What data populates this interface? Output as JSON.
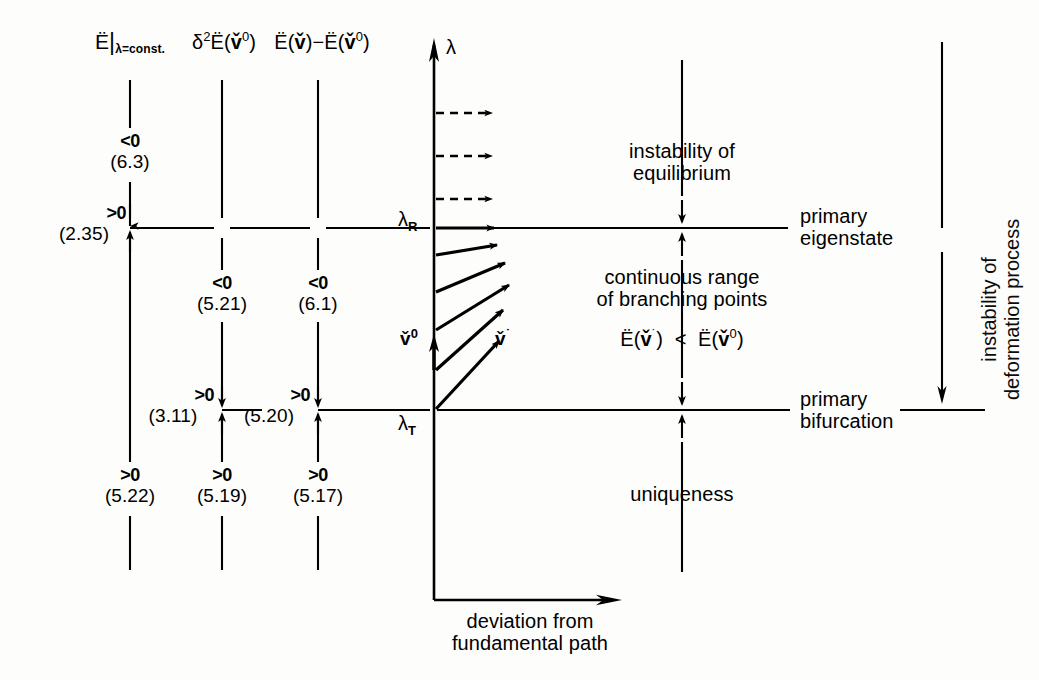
{
  "diagram": {
    "title_columns": [
      {
        "id": "col1",
        "label_html": "Ë|λ=const.",
        "x": 130
      },
      {
        "id": "col2",
        "label_html": "δ²Ë(v̌⁰)",
        "x": 222
      },
      {
        "id": "col3",
        "label_html": "Ë(v̌)−Ë(v̌⁰)",
        "x": 318
      }
    ],
    "column1": {
      "header": "Ë|λ=const.",
      "above_R": {
        "sign": "<0",
        "ref": "(6.3)"
      },
      "at_R": {
        "sign": ">0",
        "ref": "(2.35)"
      },
      "below_T": {
        "sign": ">0",
        "ref": "(5.22)"
      }
    },
    "column2": {
      "header": "δ²Ë(v̌⁰)",
      "mid": {
        "sign": "<0",
        "ref": "(5.21)"
      },
      "at_T": {
        "sign": ">0",
        "ref": "(3.11)"
      },
      "below_T": {
        "sign": ">0",
        "ref": "(5.19)"
      }
    },
    "column3": {
      "header": "Ë(v̌)−Ë(v̌⁰)",
      "mid": {
        "sign": "<0",
        "ref": "(6.1)"
      },
      "at_T": {
        "sign": ">0",
        "ref": "(5.20)"
      },
      "below_T": {
        "sign": ">0",
        "ref": "(5.17)"
      }
    },
    "axes": {
      "vertical_label": "λ",
      "horizontal_label_line1": "deviation from",
      "horizontal_label_line2": "fundamental path",
      "tick_upper": "λ",
      "tick_upper_sub": "R",
      "tick_lower": "λ",
      "tick_lower_sub": "T"
    },
    "vectors": {
      "base": "v̌",
      "base_sup": "0",
      "perturbed": "v̌",
      "perturbed_sup": "˙"
    },
    "regions": {
      "top_line1": "instability of",
      "top_line2": "equilibrium",
      "middle_line1": "continuous range",
      "middle_line2": "of branching points",
      "inequality": "Ë(v̌˙)  <  Ë(v̌⁰)",
      "bottom": "uniqueness"
    },
    "right_labels": {
      "upper_line1": "primary",
      "upper_line2": "eigenstate",
      "lower_line1": "primary",
      "lower_line2": "bifurcation",
      "rotated_line1": "instability of",
      "rotated_line2": "deformation process"
    },
    "colors": {
      "ink": "#000000",
      "paper": "#fdfdfb"
    },
    "levels": {
      "lambda_R_y": 228,
      "lambda_T_y": 410
    }
  }
}
